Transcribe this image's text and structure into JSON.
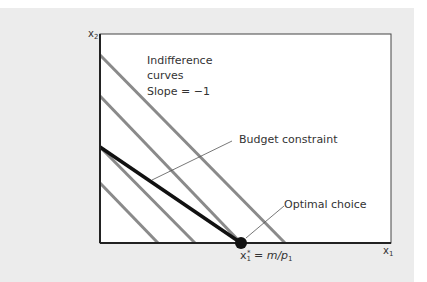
{
  "diagram": {
    "axes": {
      "y_label": "x",
      "y_label_sub": "2",
      "x_label": "x",
      "x_label_sub": "1"
    },
    "annotations": {
      "indifference_line1": "Indifference",
      "indifference_line2": "curves",
      "slope": "Slope = −1",
      "budget": "Budget constraint",
      "optimal": "Optimal choice",
      "optimum_x": "x",
      "optimum_x_sub": "1",
      "optimum_x_sup": "*",
      "optimum_eq": "= m/p",
      "optimum_eq_sub": "1"
    },
    "colors": {
      "indifference": "#8a8a8a",
      "budget": "#111111",
      "frame": "#333333",
      "panel": "#ececec"
    }
  }
}
